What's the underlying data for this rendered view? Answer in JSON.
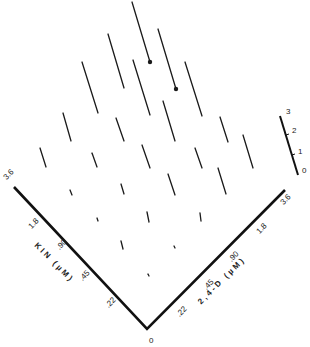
{
  "figure": {
    "type": "3d-needle-plot",
    "ink_color": "#1a1a1a",
    "background": "#ffffff"
  },
  "left_axis": {
    "title": "KIN (µM)",
    "ticks": [
      "3.6",
      "1.8",
      ".90",
      ".45",
      ".22"
    ]
  },
  "right_axis": {
    "title": "2,4-D (µM)",
    "ticks": [
      ".22",
      ".45",
      ".90",
      "1.8",
      "3.6"
    ]
  },
  "origin_label": "0",
  "scale_bar": {
    "ticks": [
      "0",
      "1",
      "2",
      "3"
    ]
  },
  "chart_data": {
    "type": "3d-bar",
    "xlabel": "2,4-D (µM)",
    "ylabel": "KIN (µM)",
    "zlabel_scale": [
      0,
      3
    ],
    "x_levels": [
      0,
      0.22,
      0.45,
      0.9,
      1.8,
      3.6
    ],
    "y_levels": [
      0,
      0.22,
      0.45,
      0.9,
      1.8,
      3.6
    ],
    "marked_points": "two tallest bars near top carry filled dot markers at their bases",
    "bars_px": [
      {
        "x1": 132,
        "y1": 2,
        "x2": 150,
        "y2": 62,
        "dot": true
      },
      {
        "x1": 158,
        "y1": 29,
        "x2": 176,
        "y2": 89,
        "dot": true
      },
      {
        "x1": 108,
        "y1": 34,
        "x2": 124,
        "y2": 88
      },
      {
        "x1": 133,
        "y1": 60,
        "x2": 150,
        "y2": 115
      },
      {
        "x1": 185,
        "y1": 62,
        "x2": 202,
        "y2": 116
      },
      {
        "x1": 82,
        "y1": 62,
        "x2": 98,
        "y2": 113
      },
      {
        "x1": 163,
        "y1": 101,
        "x2": 175,
        "y2": 141
      },
      {
        "x1": 63,
        "y1": 113,
        "x2": 71,
        "y2": 141
      },
      {
        "x1": 116,
        "y1": 118,
        "x2": 124,
        "y2": 141
      },
      {
        "x1": 220,
        "y1": 117,
        "x2": 228,
        "y2": 142
      },
      {
        "x1": 243,
        "y1": 135,
        "x2": 253,
        "y2": 168
      },
      {
        "x1": 40,
        "y1": 148,
        "x2": 46,
        "y2": 167
      },
      {
        "x1": 92,
        "y1": 153,
        "x2": 97,
        "y2": 167
      },
      {
        "x1": 142,
        "y1": 145,
        "x2": 150,
        "y2": 168
      },
      {
        "x1": 195,
        "y1": 148,
        "x2": 202,
        "y2": 168
      },
      {
        "x1": 218,
        "y1": 168,
        "x2": 226,
        "y2": 194
      },
      {
        "x1": 70,
        "y1": 190,
        "x2": 72,
        "y2": 195
      },
      {
        "x1": 121,
        "y1": 184,
        "x2": 124,
        "y2": 194
      },
      {
        "x1": 168,
        "y1": 174,
        "x2": 175,
        "y2": 195
      },
      {
        "x1": 97,
        "y1": 218,
        "x2": 98,
        "y2": 221
      },
      {
        "x1": 147,
        "y1": 212,
        "x2": 149,
        "y2": 222
      },
      {
        "x1": 200,
        "y1": 213,
        "x2": 201,
        "y2": 221
      },
      {
        "x1": 121,
        "y1": 241,
        "x2": 123,
        "y2": 249
      },
      {
        "x1": 174,
        "y1": 246,
        "x2": 175,
        "y2": 248
      },
      {
        "x1": 148,
        "y1": 274,
        "x2": 149,
        "y2": 276
      }
    ]
  }
}
